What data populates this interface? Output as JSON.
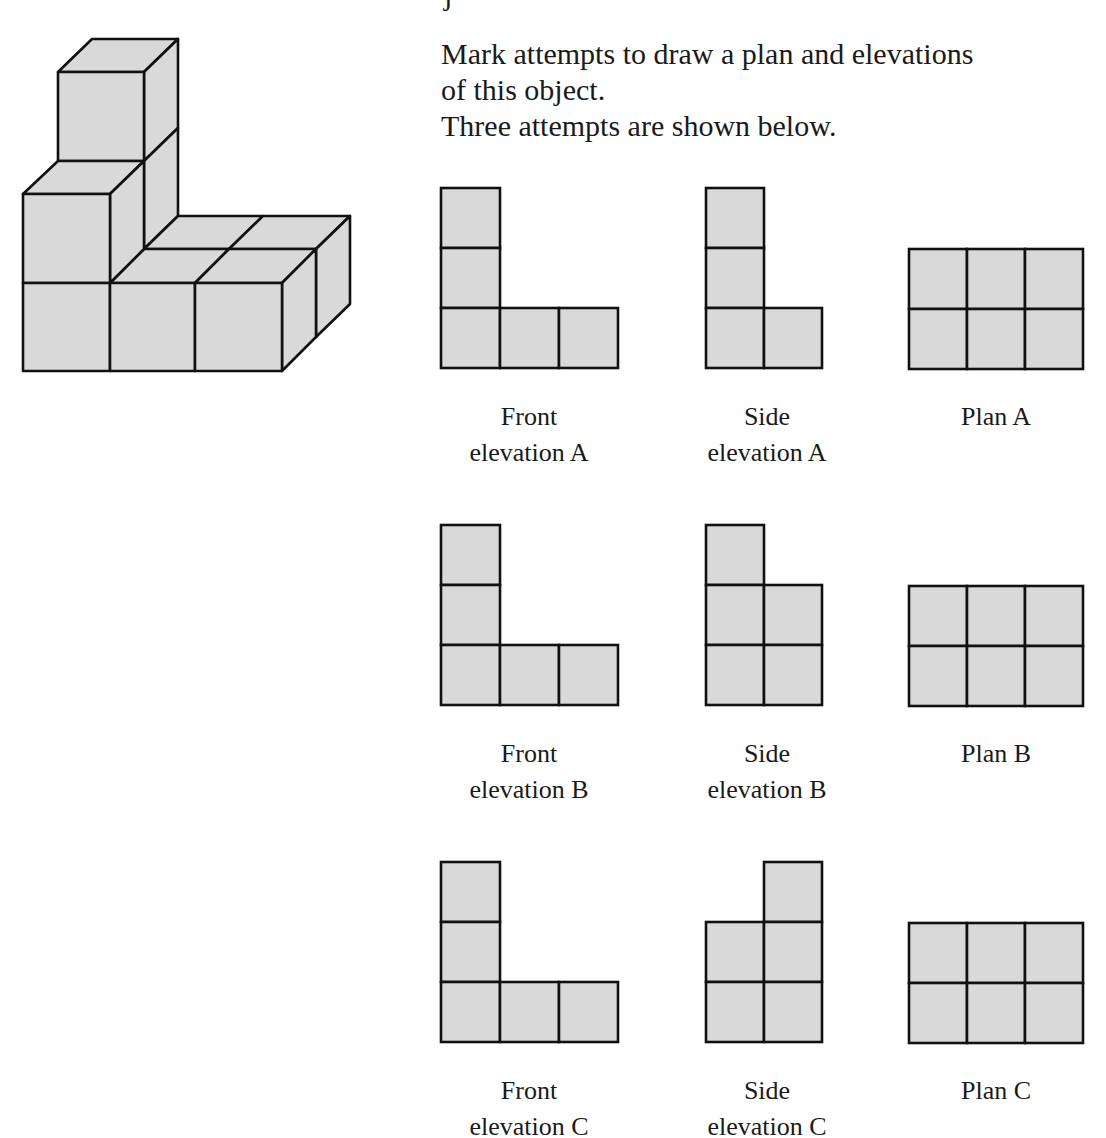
{
  "intro": {
    "cropped_top": "j",
    "lines": [
      "Mark attempts to draw a plan and elevations",
      "of this object.",
      "Three attempts are shown below."
    ]
  },
  "colors": {
    "fill": "#d9d9d9",
    "stroke": "#111111"
  },
  "attempts": [
    {
      "id": "A",
      "front_label": [
        "Front",
        "elevation A"
      ],
      "side_label": [
        "Side",
        "elevation A"
      ],
      "plan_label": "Plan A",
      "front_cells": [
        [
          0,
          0
        ],
        [
          0,
          1
        ],
        [
          0,
          2
        ],
        [
          1,
          2
        ],
        [
          2,
          2
        ]
      ],
      "side_cells": [
        [
          0,
          0
        ],
        [
          0,
          1
        ],
        [
          0,
          2
        ],
        [
          1,
          2
        ]
      ],
      "plan_cells": [
        [
          0,
          0
        ],
        [
          1,
          0
        ],
        [
          2,
          0
        ],
        [
          0,
          1
        ],
        [
          1,
          1
        ],
        [
          2,
          1
        ]
      ]
    },
    {
      "id": "B",
      "front_label": [
        "Front",
        "elevation B"
      ],
      "side_label": [
        "Side",
        "elevation B"
      ],
      "plan_label": "Plan B",
      "front_cells": [
        [
          0,
          0
        ],
        [
          0,
          1
        ],
        [
          0,
          2
        ],
        [
          1,
          2
        ],
        [
          2,
          2
        ]
      ],
      "side_cells": [
        [
          0,
          0
        ],
        [
          0,
          1
        ],
        [
          1,
          1
        ],
        [
          0,
          2
        ],
        [
          1,
          2
        ]
      ],
      "plan_cells": [
        [
          0,
          0
        ],
        [
          1,
          0
        ],
        [
          2,
          0
        ],
        [
          0,
          1
        ],
        [
          1,
          1
        ],
        [
          2,
          1
        ]
      ]
    },
    {
      "id": "C",
      "front_label": [
        "Front",
        "elevation C"
      ],
      "side_label": [
        "Side",
        "elevation C"
      ],
      "plan_label": "Plan C",
      "front_cells": [
        [
          0,
          0
        ],
        [
          0,
          1
        ],
        [
          0,
          2
        ],
        [
          1,
          2
        ],
        [
          2,
          2
        ]
      ],
      "side_cells": [
        [
          1,
          0
        ],
        [
          0,
          1
        ],
        [
          1,
          1
        ],
        [
          0,
          2
        ],
        [
          1,
          2
        ]
      ],
      "plan_cells": [
        [
          0,
          0
        ],
        [
          1,
          0
        ],
        [
          2,
          0
        ],
        [
          0,
          1
        ],
        [
          1,
          1
        ],
        [
          2,
          1
        ]
      ]
    }
  ]
}
